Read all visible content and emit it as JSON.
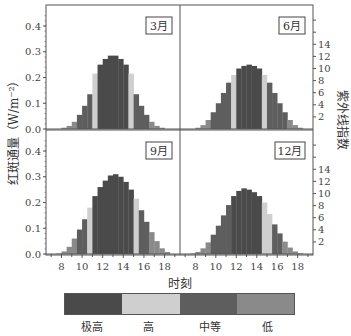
{
  "chart_data": [
    {
      "type": "bar",
      "panel": "3月",
      "x": [
        7.5,
        8,
        8.5,
        9,
        9.5,
        10,
        10.5,
        11,
        11.5,
        12,
        12.5,
        13,
        13.5,
        14,
        14.5,
        15,
        15.5,
        16,
        16.5,
        17,
        17.5,
        18
      ],
      "values": [
        0.0,
        0.005,
        0.012,
        0.028,
        0.055,
        0.09,
        0.135,
        0.215,
        0.25,
        0.272,
        0.285,
        0.285,
        0.272,
        0.25,
        0.215,
        0.135,
        0.09,
        0.055,
        0.028,
        0.012,
        0.005,
        0.0
      ],
      "categories_level": [
        "低",
        "低",
        "低",
        "低",
        "中等",
        "中等",
        "中等",
        "高",
        "极高",
        "极高",
        "极高",
        "极高",
        "极高",
        "极高",
        "高",
        "中等",
        "中等",
        "中等",
        "低",
        "低",
        "低",
        "低"
      ]
    },
    {
      "type": "bar",
      "panel": "6月",
      "x": [
        7.5,
        8,
        8.5,
        9,
        9.5,
        10,
        10.5,
        11,
        11.5,
        12,
        12.5,
        13,
        13.5,
        14,
        14.5,
        15,
        15.5,
        16,
        16.5,
        17,
        17.5,
        18
      ],
      "values": [
        0.0,
        0.005,
        0.015,
        0.035,
        0.065,
        0.1,
        0.14,
        0.18,
        0.21,
        0.235,
        0.245,
        0.25,
        0.245,
        0.235,
        0.21,
        0.18,
        0.14,
        0.1,
        0.065,
        0.035,
        0.015,
        0.005
      ],
      "categories_level": [
        "低",
        "低",
        "低",
        "低",
        "中等",
        "中等",
        "中等",
        "中等",
        "高",
        "极高",
        "极高",
        "极高",
        "极高",
        "极高",
        "高",
        "中等",
        "中等",
        "中等",
        "中等",
        "低",
        "低",
        "低"
      ]
    },
    {
      "type": "bar",
      "panel": "9月",
      "x": [
        7.5,
        8,
        8.5,
        9,
        9.5,
        10,
        10.5,
        11,
        11.5,
        12,
        12.5,
        13,
        13.5,
        14,
        14.5,
        15,
        15.5,
        16,
        16.5,
        17,
        17.5,
        18
      ],
      "values": [
        0.002,
        0.01,
        0.028,
        0.06,
        0.095,
        0.135,
        0.18,
        0.225,
        0.26,
        0.285,
        0.305,
        0.31,
        0.3,
        0.28,
        0.25,
        0.215,
        0.17,
        0.125,
        0.085,
        0.05,
        0.022,
        0.008
      ],
      "categories_level": [
        "低",
        "低",
        "低",
        "低",
        "中等",
        "中等",
        "高",
        "极高",
        "极高",
        "极高",
        "极高",
        "极高",
        "极高",
        "极高",
        "极高",
        "高",
        "中等",
        "中等",
        "低",
        "低",
        "低",
        "低"
      ]
    },
    {
      "type": "bar",
      "panel": "12月",
      "x": [
        7.5,
        8,
        8.5,
        9,
        9.5,
        10,
        10.5,
        11,
        11.5,
        12,
        12.5,
        13,
        13.5,
        14,
        14.5,
        15,
        15.5,
        16,
        16.5,
        17,
        17.5,
        18
      ],
      "values": [
        0.002,
        0.008,
        0.022,
        0.045,
        0.075,
        0.11,
        0.15,
        0.19,
        0.225,
        0.245,
        0.255,
        0.25,
        0.24,
        0.225,
        0.2,
        0.155,
        0.115,
        0.08,
        0.048,
        0.025,
        0.01,
        0.003
      ],
      "categories_level": [
        "低",
        "低",
        "低",
        "低",
        "中等",
        "中等",
        "中等",
        "中等",
        "极高",
        "极高",
        "极高",
        "极高",
        "极高",
        "极高",
        "高",
        "高",
        "中等",
        "中等",
        "低",
        "低",
        "低",
        "低"
      ]
    }
  ],
  "axes": {
    "ylabel_left": "红斑通量（W/m⁻²）",
    "ylabel_right": "紫外线指数",
    "xlabel": "时刻",
    "left_ticks": [
      "0.0",
      "0.1",
      "0.2",
      "0.3",
      "0.4"
    ],
    "right_ticks": [
      "2",
      "4",
      "6",
      "8",
      "10",
      "12",
      "14"
    ],
    "x_ticks": [
      "8",
      "10",
      "12",
      "14",
      "16",
      "18"
    ],
    "ylim": [
      0,
      0.47
    ],
    "xlim": [
      6.5,
      19.5
    ]
  },
  "panels": [
    "3月",
    "6月",
    "9月",
    "12月"
  ],
  "legend": {
    "items": [
      {
        "label": "极高",
        "color": "#4a4a4a"
      },
      {
        "label": "高",
        "color": "#cfcfcf"
      },
      {
        "label": "中等",
        "color": "#5e5e5e"
      },
      {
        "label": "低",
        "color": "#8a8a8a"
      }
    ]
  },
  "colors": {
    "极高": "#4a4a4a",
    "高": "#cfcfcf",
    "中等": "#5e5e5e",
    "低": "#8a8a8a",
    "axis": "#555555",
    "text": "#333333"
  }
}
